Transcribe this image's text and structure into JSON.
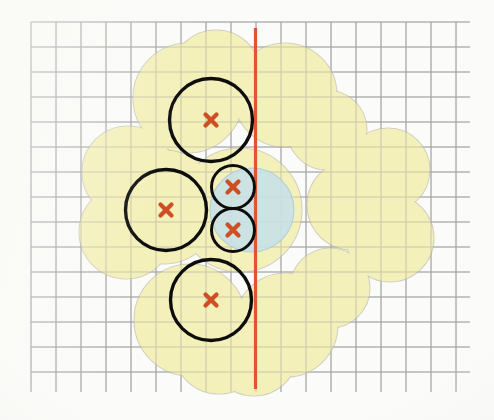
{
  "figure": {
    "title": "Circle packing with dilated union region and bisecting line",
    "width": 494,
    "height": 420,
    "background_color": "#fbfbf9"
  },
  "colors": {
    "paper": "#fbfbf9",
    "grid_line": "#9b9c9e",
    "grid_line_light": "#b9babc",
    "region_yellow_fill": "#f4efb4",
    "region_yellow_stroke": "#c9c9b0",
    "region_blue_fill": "#c7e1ea",
    "region_blue_stroke": "#a8ccd8",
    "circle_outline": "#111111",
    "marker_cross": "#cf4f25",
    "separator_line": "#e04f26"
  },
  "grid": {
    "label": "graph paper grid",
    "spacing_px": 25,
    "x_start": 31,
    "x_end": 470,
    "y_start": 22,
    "y_end": 392,
    "visible": true,
    "columns": 18,
    "rows": 15
  },
  "separator_line": {
    "label": "vertical red separator line",
    "orientation": "vertical",
    "x": 255.5,
    "y_top": 28,
    "y_bottom": 389,
    "stroke_width": 3.2,
    "color": "#e04f26"
  },
  "chart_data": {
    "type": "scatter",
    "title": "Circle packing with dilated union region and bisecting line",
    "xlabel": "",
    "ylabel": "",
    "grid": true,
    "legend_position": "none",
    "units": "pixels",
    "xlim": [
      31,
      470
    ],
    "ylim": [
      22,
      392
    ],
    "series": [
      {
        "name": "packed circles (black outline)",
        "stroke": "#111111",
        "fill": "none",
        "values": [
          {
            "id": "C1",
            "label": "top circle",
            "cx": 211,
            "cy": 120,
            "r": 41.5,
            "stroke_width": 3.4,
            "marker": "x"
          },
          {
            "id": "C2",
            "label": "left circle",
            "cx": 166,
            "cy": 210,
            "r": 40.5,
            "stroke_width": 3.4,
            "marker": "x"
          },
          {
            "id": "C3",
            "label": "bottom circle",
            "cx": 211,
            "cy": 300,
            "r": 40.5,
            "stroke_width": 3.4,
            "marker": "x"
          },
          {
            "id": "C4",
            "label": "small upper circle",
            "cx": 233,
            "cy": 187,
            "r": 21.5,
            "stroke_width": 3.0,
            "marker": "x"
          },
          {
            "id": "C5",
            "label": "small lower circle",
            "cx": 233,
            "cy": 230,
            "r": 21.5,
            "stroke_width": 3.0,
            "marker": "x"
          }
        ]
      },
      {
        "name": "center blue disk",
        "fill": "#c7e1ea",
        "stroke": "#a8ccd8",
        "values": [
          {
            "id": "B1",
            "label": "blue disk",
            "cx": 252,
            "cy": 210,
            "r": 42
          }
        ]
      },
      {
        "name": "dilated union region (yellow petals)",
        "fill": "#f4efb4",
        "stroke": "#c9c9b0",
        "values": [
          {
            "id": "Y1",
            "label": "petal top-left inner",
            "cx": 188,
            "cy": 98,
            "r": 55
          },
          {
            "id": "Y2",
            "label": "petal top-left outer",
            "cx": 216,
            "cy": 75,
            "r": 45
          },
          {
            "id": "Y3",
            "label": "petal top-right inner",
            "cx": 285,
            "cy": 95,
            "r": 52
          },
          {
            "id": "Y4",
            "label": "petal top-right outer",
            "cx": 327,
            "cy": 130,
            "r": 40
          },
          {
            "id": "Y5",
            "label": "petal left-upper",
            "cx": 128,
            "cy": 172,
            "r": 46
          },
          {
            "id": "Y6",
            "label": "petal left-lower",
            "cx": 126,
            "cy": 232,
            "r": 47
          },
          {
            "id": "Y7",
            "label": "petal left-mid",
            "cx": 163,
            "cy": 207,
            "r": 57
          },
          {
            "id": "Y8",
            "label": "petal right-upper",
            "cx": 388,
            "cy": 170,
            "r": 42
          },
          {
            "id": "Y9",
            "label": "petal right-mid",
            "cx": 352,
            "cy": 205,
            "r": 45
          },
          {
            "id": "Y10",
            "label": "petal right-lower",
            "cx": 390,
            "cy": 238,
            "r": 44
          },
          {
            "id": "Y11",
            "label": "petal bottom-left",
            "cx": 190,
            "cy": 320,
            "r": 56
          },
          {
            "id": "Y12",
            "label": "petal bottom-left low",
            "cx": 219,
            "cy": 348,
            "r": 46
          },
          {
            "id": "Y13",
            "label": "petal bottom-right",
            "cx": 286,
            "cy": 325,
            "r": 52
          },
          {
            "id": "Y14",
            "label": "petal bottom-right low",
            "cx": 254,
            "cy": 352,
            "r": 44
          },
          {
            "id": "Y15",
            "label": "petal right-bottom arm",
            "cx": 330,
            "cy": 288,
            "r": 40
          },
          {
            "id": "Y16",
            "label": "core fill",
            "cx": 240,
            "cy": 210,
            "r": 62
          }
        ]
      }
    ],
    "markers": {
      "name": "circle centers",
      "glyph": "x",
      "color": "#cf4f25",
      "size_px": 11,
      "points": [
        {
          "cx": 211,
          "cy": 120
        },
        {
          "cx": 166,
          "cy": 210
        },
        {
          "cx": 211,
          "cy": 300
        },
        {
          "cx": 233,
          "cy": 187
        },
        {
          "cx": 233,
          "cy": 230
        }
      ]
    },
    "annotations": [
      {
        "type": "vline",
        "x": 255.5,
        "color": "#e04f26",
        "label": "bisecting line"
      }
    ]
  }
}
